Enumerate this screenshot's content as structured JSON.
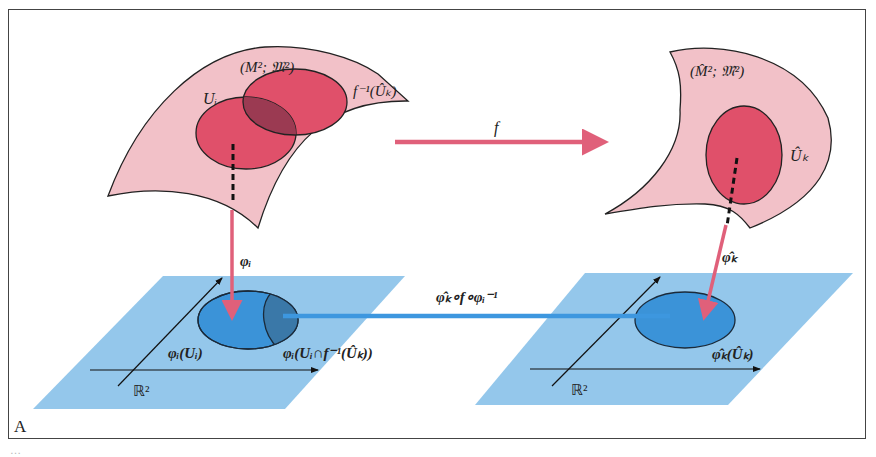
{
  "figure": {
    "panel_label": "A",
    "caption_partial": "…"
  },
  "left_manifold": {
    "label": "(M²; 𝔐²)",
    "chart_domain_label": "Uᵢ",
    "preimage_label": "f⁻¹(Ûₖ)"
  },
  "right_manifold": {
    "label": "(M̂²; 𝔐̂²)",
    "chart_domain_label": "Ûₖ"
  },
  "maps": {
    "f_label": "f",
    "phi_i_label": "φᵢ",
    "phi_hat_k_label": "φ̂ₖ",
    "transition_label": "φ̂ₖ∘f∘φᵢ⁻¹"
  },
  "left_plane": {
    "space_label": "ℝ²",
    "image_label": "φᵢ(Uᵢ)",
    "intersection_label": "φᵢ(Uᵢ∩f⁻¹(Ûₖ))"
  },
  "right_plane": {
    "space_label": "ℝ²",
    "image_label": "φ̂ₖ(Ûₖ)"
  },
  "colors": {
    "manifold_fill": "#f2c1c8",
    "chart_fill": "#e0506a",
    "overlap_fill": "#9b3a52",
    "plane_fill": "#8ec4ea",
    "plane_ellipse": "#3b93d8",
    "plane_overlap": "#3a78a8",
    "map_arrow_pink": "#e0607a",
    "map_arrow_blue": "#3d97df"
  }
}
